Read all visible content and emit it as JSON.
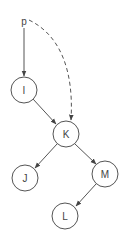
{
  "diagram": {
    "pointer": {
      "label": "p",
      "x": 24,
      "y": 22
    },
    "nodes": [
      {
        "id": "I",
        "label": "I",
        "x": 24,
        "y": 90
      },
      {
        "id": "K",
        "label": "K",
        "x": 66,
        "y": 134
      },
      {
        "id": "J",
        "label": "J",
        "x": 25,
        "y": 178
      },
      {
        "id": "M",
        "label": "M",
        "x": 105,
        "y": 174
      },
      {
        "id": "L",
        "label": "L",
        "x": 65,
        "y": 216
      }
    ],
    "edges": [
      {
        "from": "p",
        "to": "I",
        "style": "solid"
      },
      {
        "from": "p",
        "to": "K",
        "style": "dashed"
      },
      {
        "from": "I",
        "to": "K",
        "style": "solid"
      },
      {
        "from": "K",
        "to": "J",
        "style": "solid"
      },
      {
        "from": "K",
        "to": "M",
        "style": "solid"
      },
      {
        "from": "M",
        "to": "L",
        "style": "solid"
      }
    ],
    "node_radius": 13,
    "stroke_color": "#555555"
  }
}
